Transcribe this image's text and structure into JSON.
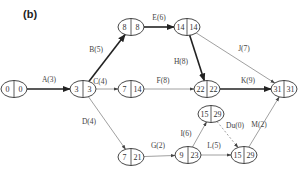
{
  "figure_label": "(b)",
  "nodes": [
    {
      "id": "n0",
      "early": "0",
      "late": "0",
      "cx": 14,
      "cy": 89
    },
    {
      "id": "n1",
      "early": "3",
      "late": "3",
      "cx": 83,
      "cy": 89
    },
    {
      "id": "n2",
      "early": "8",
      "late": "8",
      "cx": 131,
      "cy": 27
    },
    {
      "id": "n3",
      "early": "7",
      "late": "14",
      "cx": 131,
      "cy": 89
    },
    {
      "id": "n4",
      "early": "14",
      "late": "14",
      "cx": 187,
      "cy": 27
    },
    {
      "id": "n5",
      "early": "22",
      "late": "22",
      "cx": 207,
      "cy": 89
    },
    {
      "id": "n6",
      "early": "31",
      "late": "31",
      "cx": 284,
      "cy": 89
    },
    {
      "id": "n7",
      "early": "7",
      "late": "21",
      "cx": 131,
      "cy": 157
    },
    {
      "id": "n8",
      "early": "9",
      "late": "23",
      "cx": 188,
      "cy": 155
    },
    {
      "id": "n9",
      "early": "15",
      "late": "29",
      "cx": 211,
      "cy": 114
    },
    {
      "id": "n10",
      "early": "15",
      "late": "29",
      "cx": 244,
      "cy": 155
    }
  ],
  "edges": [
    {
      "label": "A(3)",
      "from": "n0",
      "to": "n1",
      "critical": true,
      "dashed": false
    },
    {
      "label": "B(5)",
      "from": "n1",
      "to": "n2",
      "critical": true,
      "dashed": false
    },
    {
      "label": "C(4)",
      "from": "n1",
      "to": "n3",
      "critical": false,
      "dashed": false
    },
    {
      "label": "D(4)",
      "from": "n1",
      "to": "n7",
      "critical": false,
      "dashed": false
    },
    {
      "label": "E(6)",
      "from": "n2",
      "to": "n4",
      "critical": true,
      "dashed": false
    },
    {
      "label": "F(8)",
      "from": "n3",
      "to": "n5",
      "critical": false,
      "dashed": false
    },
    {
      "label": "H(8)",
      "from": "n4",
      "to": "n5",
      "critical": true,
      "dashed": false
    },
    {
      "label": "J(7)",
      "from": "n4",
      "to": "n6",
      "critical": false,
      "dashed": false
    },
    {
      "label": "K(9)",
      "from": "n5",
      "to": "n6",
      "critical": true,
      "dashed": false
    },
    {
      "label": "G(2)",
      "from": "n7",
      "to": "n8",
      "critical": false,
      "dashed": false
    },
    {
      "label": "I(6)",
      "from": "n8",
      "to": "n9",
      "critical": false,
      "dashed": false
    },
    {
      "label": "L(5)",
      "from": "n8",
      "to": "n10",
      "critical": false,
      "dashed": false
    },
    {
      "label": "Du(0)",
      "from": "n9",
      "to": "n10",
      "critical": false,
      "dashed": true
    },
    {
      "label": "M(2)",
      "from": "n10",
      "to": "n6",
      "critical": false,
      "dashed": false
    }
  ],
  "colors": {
    "critical": "#222222",
    "normal": "#888888",
    "node_stroke": "#333333"
  }
}
